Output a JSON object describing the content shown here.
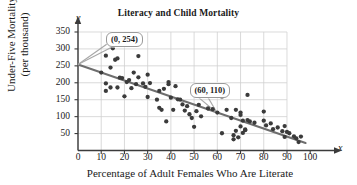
{
  "chart_data": {
    "type": "scatter",
    "title": "Literacy and Child Mortality",
    "xlabel": "Percentage of Adult Females Who Are Literate",
    "ylabel_line1": "Under-Five Mortality",
    "ylabel_line2": "(per thousand)",
    "x_axis_variable": "x",
    "y_axis_variable": "y",
    "xlim": [
      0,
      100
    ],
    "ylim": [
      0,
      350
    ],
    "xticks": [
      0,
      10,
      20,
      30,
      40,
      50,
      60,
      70,
      80,
      90,
      100
    ],
    "yticks": [
      50,
      100,
      150,
      200,
      250,
      300,
      350
    ],
    "grid": true,
    "grid_x_range": [
      0,
      90
    ],
    "grid_y_range": [
      0,
      350
    ],
    "legend": "none",
    "point_color": "#3b3b3b",
    "line_color": "#6e6e6e",
    "grid_color": "#d0d0d0",
    "axis_color": "#3b3b3b",
    "trend_line": {
      "label": "line of best fit",
      "points": [
        [
          0,
          254
        ],
        [
          98,
          22
        ]
      ],
      "annotated_points": [
        {
          "label": "(0, 254)",
          "x": 0,
          "y": 254
        },
        {
          "label": "(60, 110)",
          "x": 60,
          "y": 110
        }
      ]
    },
    "annotations": [
      {
        "text": "(0, 254)",
        "target_x": 0,
        "target_y": 254,
        "box_x": 12,
        "box_y": 347
      },
      {
        "text": "(60, 110)",
        "target_x": 60,
        "target_y": 110,
        "box_x": 48,
        "box_y": 196
      }
    ],
    "points": [
      [
        10,
        230
      ],
      [
        12,
        280
      ],
      [
        12,
        198
      ],
      [
        12,
        176
      ],
      [
        14,
        245
      ],
      [
        14,
        186
      ],
      [
        15,
        302
      ],
      [
        16,
        268
      ],
      [
        17,
        272
      ],
      [
        17,
        186
      ],
      [
        18,
        215
      ],
      [
        19,
        214
      ],
      [
        20,
        160
      ],
      [
        21,
        202
      ],
      [
        22,
        208
      ],
      [
        23,
        184
      ],
      [
        24,
        230
      ],
      [
        25,
        196
      ],
      [
        26,
        279
      ],
      [
        26,
        216
      ],
      [
        28,
        198
      ],
      [
        29,
        188
      ],
      [
        30,
        224
      ],
      [
        30,
        158
      ],
      [
        31,
        199
      ],
      [
        34,
        150
      ],
      [
        35,
        176
      ],
      [
        35,
        126
      ],
      [
        36,
        120
      ],
      [
        37,
        182
      ],
      [
        38,
        86
      ],
      [
        39,
        202
      ],
      [
        39,
        196
      ],
      [
        40,
        156
      ],
      [
        41,
        120
      ],
      [
        42,
        190
      ],
      [
        43,
        151
      ],
      [
        44,
        150
      ],
      [
        45,
        136
      ],
      [
        46,
        118
      ],
      [
        47,
        131
      ],
      [
        48,
        107
      ],
      [
        49,
        96
      ],
      [
        50,
        163
      ],
      [
        50,
        70
      ],
      [
        51,
        116
      ],
      [
        52,
        135
      ],
      [
        53,
        101
      ],
      [
        56,
        124
      ],
      [
        58,
        122
      ],
      [
        60,
        112
      ],
      [
        62,
        158
      ],
      [
        62,
        51
      ],
      [
        64,
        120
      ],
      [
        66,
        96
      ],
      [
        67,
        33
      ],
      [
        67,
        45
      ],
      [
        68,
        120
      ],
      [
        68,
        58
      ],
      [
        69,
        39
      ],
      [
        70,
        112
      ],
      [
        70,
        105
      ],
      [
        70,
        71
      ],
      [
        71,
        88
      ],
      [
        71,
        52
      ],
      [
        72,
        62
      ],
      [
        72,
        60
      ],
      [
        73,
        164
      ],
      [
        73,
        90
      ],
      [
        74,
        86
      ],
      [
        76,
        82
      ],
      [
        80,
        115
      ],
      [
        80,
        88
      ],
      [
        81,
        74
      ],
      [
        83,
        80
      ],
      [
        84,
        63
      ],
      [
        86,
        68
      ],
      [
        88,
        57
      ],
      [
        89,
        72
      ],
      [
        89,
        40
      ],
      [
        90,
        55
      ],
      [
        91,
        51
      ],
      [
        93,
        42
      ],
      [
        94,
        36
      ],
      [
        95,
        25
      ],
      [
        96,
        41
      ]
    ]
  }
}
